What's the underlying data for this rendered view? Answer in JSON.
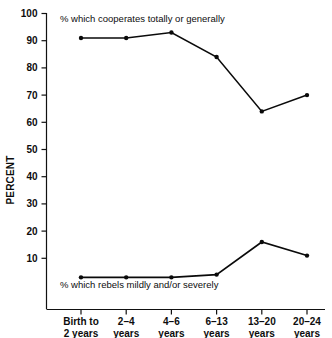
{
  "chart_data": {
    "type": "line",
    "title": "",
    "xlabel": "",
    "ylabel": "PERCENT",
    "ylim": [
      0,
      100
    ],
    "ytick_values": [
      10,
      20,
      30,
      40,
      50,
      60,
      70,
      80,
      90,
      100
    ],
    "ytick_labels": [
      "10",
      "20",
      "30",
      "40",
      "50",
      "60",
      "70",
      "80",
      "90",
      "100"
    ],
    "grid": false,
    "legend_position": "inline-annotations",
    "categories": [
      "Birth to\n2 years",
      "2–4\nyears",
      "4–6\nyears",
      "6–13\nyears",
      "13–20\nyears",
      "20–24\nyears"
    ],
    "category_lines": [
      [
        "Birth to",
        "2 years"
      ],
      [
        "2–4",
        "years"
      ],
      [
        "4–6",
        "years"
      ],
      [
        "6–13",
        "years"
      ],
      [
        "13–20",
        "years"
      ],
      [
        "20–24",
        "years"
      ]
    ],
    "series": [
      {
        "name": "% which cooperates totally or generally",
        "values": [
          91,
          91,
          93,
          84,
          64,
          70
        ]
      },
      {
        "name": "% which rebels mildly and/or severely",
        "values": [
          3,
          3,
          3,
          4,
          16,
          11
        ]
      }
    ],
    "annotations": [
      {
        "text": "% which cooperates totally or generally",
        "series": "% which cooperates totally or generally"
      },
      {
        "text": "% which rebels mildly and/or severely",
        "series": "% which rebels mildly and/or severely"
      }
    ]
  }
}
